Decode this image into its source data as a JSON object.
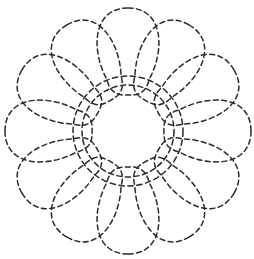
{
  "figure": {
    "style": "black dashed outline on white background",
    "background_color": "#ffffff",
    "stroke_color": "#2b2b2b",
    "stroke_width": 1.5,
    "dash_pattern": "5 3.4",
    "canvas": {
      "width": 254,
      "height": 259
    },
    "bounds": {
      "x_min": 15,
      "y_min": 12,
      "x_max": 243,
      "y_max": 248
    },
    "center": {
      "x": 128,
      "y": 131
    }
  },
  "center_rings": [
    {
      "name": "outer-center-ring",
      "cx": 128,
      "cy": 131,
      "r": 55,
      "dash": "5.4 3.6"
    },
    {
      "name": "inner-center-ring",
      "cx": 128,
      "cy": 131,
      "r": 46,
      "dash": "5.2 3.5"
    }
  ],
  "petals": {
    "count": 12,
    "ring_radius": 79,
    "petal_rx": 35,
    "petal_ry": 44,
    "start_angle_deg": -90,
    "items": [
      {
        "index": 1,
        "angle_deg": -90,
        "cx": 128,
        "cy": 52,
        "label": "petal-12-oclock"
      },
      {
        "index": 2,
        "angle_deg": -60,
        "cx": 167,
        "cy": 63,
        "label": "petal-1-oclock"
      },
      {
        "index": 3,
        "angle_deg": -30,
        "cx": 196,
        "cy": 92,
        "label": "petal-2-oclock"
      },
      {
        "index": 4,
        "angle_deg": 0,
        "cx": 207,
        "cy": 131,
        "label": "petal-3-oclock"
      },
      {
        "index": 5,
        "angle_deg": 30,
        "cx": 196,
        "cy": 171,
        "label": "petal-4-oclock"
      },
      {
        "index": 6,
        "angle_deg": 60,
        "cx": 167,
        "cy": 199,
        "label": "petal-5-oclock"
      },
      {
        "index": 7,
        "angle_deg": 90,
        "cx": 128,
        "cy": 210,
        "label": "petal-6-oclock"
      },
      {
        "index": 8,
        "angle_deg": 120,
        "cx": 89,
        "cy": 199,
        "label": "petal-7-oclock"
      },
      {
        "index": 9,
        "angle_deg": 150,
        "cx": 60,
        "cy": 171,
        "label": "petal-8-oclock"
      },
      {
        "index": 10,
        "angle_deg": 180,
        "cx": 49,
        "cy": 131,
        "label": "petal-9-oclock"
      },
      {
        "index": 11,
        "angle_deg": 210,
        "cx": 60,
        "cy": 92,
        "label": "petal-10-oclock"
      },
      {
        "index": 12,
        "angle_deg": 240,
        "cx": 89,
        "cy": 63,
        "label": "petal-11-oclock"
      }
    ]
  }
}
